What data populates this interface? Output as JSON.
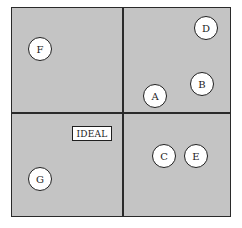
{
  "diagram": {
    "type": "quadrant",
    "ideal_label": "IDEAL",
    "nodes": [
      {
        "label": "F",
        "x": 40,
        "y": 49
      },
      {
        "label": "D",
        "x": 206,
        "y": 28
      },
      {
        "label": "B",
        "x": 202,
        "y": 84
      },
      {
        "label": "A",
        "x": 155,
        "y": 96
      },
      {
        "label": "C",
        "x": 164,
        "y": 156
      },
      {
        "label": "E",
        "x": 196,
        "y": 156
      },
      {
        "label": "G",
        "x": 40,
        "y": 179
      }
    ]
  }
}
